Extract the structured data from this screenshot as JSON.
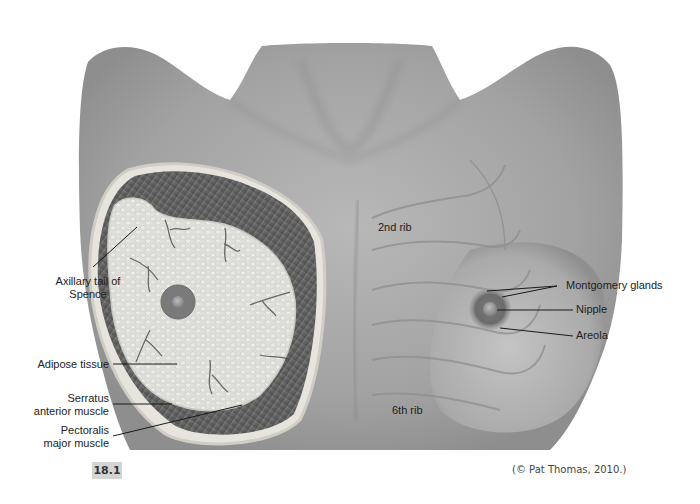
{
  "figure": {
    "number": "18.1",
    "credit": "(© Pat Thomas, 2010.)"
  },
  "labels": {
    "left": {
      "axillary_tail": [
        "Axillary tail of",
        "Spence"
      ],
      "adipose": "Adipose tissue",
      "serratus": [
        "Serratus",
        "anterior muscle"
      ],
      "pectoralis": [
        "Pectoralis",
        "major muscle"
      ]
    },
    "center": {
      "rib2": "2nd rib",
      "rib6": "6th rib"
    },
    "right": {
      "montgomery": "Montgomery glands",
      "nipple": "Nipple",
      "areola": "Areola"
    }
  },
  "colors": {
    "skin": "#a9a9a9",
    "skin_dark": "#8c8c8c",
    "muscle": "#5e5e5e",
    "adipose": "#dcdcd6",
    "label_text": "#222222",
    "badge_bg": "#d4d4d4"
  }
}
